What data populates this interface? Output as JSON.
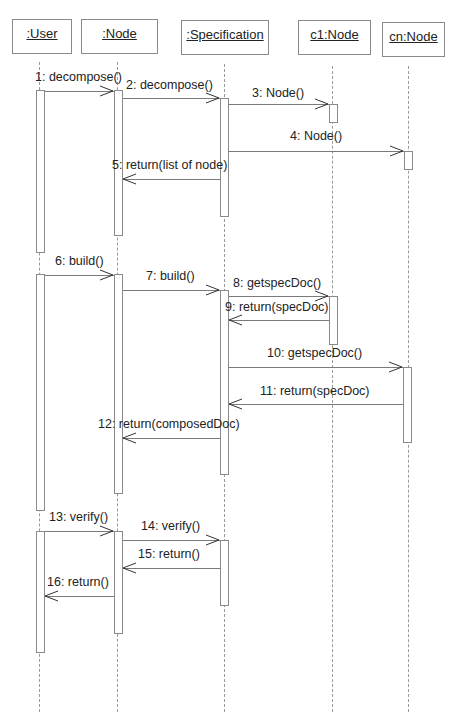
{
  "diagram": {
    "type": "uml-sequence",
    "objects": [
      {
        "id": "user",
        "label": ":User"
      },
      {
        "id": "node",
        "label": ":Node"
      },
      {
        "id": "spec",
        "label": ":Specification"
      },
      {
        "id": "c1",
        "label": "c1:Node"
      },
      {
        "id": "cn",
        "label": "cn:Node"
      }
    ],
    "messages": [
      {
        "n": 1,
        "label": "1: decompose()",
        "from": ":User",
        "to": ":Node",
        "kind": "call"
      },
      {
        "n": 2,
        "label": "2: decompose()",
        "from": ":Node",
        "to": ":Specification",
        "kind": "call"
      },
      {
        "n": 3,
        "label": "3: Node()",
        "from": ":Specification",
        "to": "c1:Node",
        "kind": "create"
      },
      {
        "n": 4,
        "label": "4: Node()",
        "from": ":Specification",
        "to": "cn:Node",
        "kind": "create"
      },
      {
        "n": 5,
        "label": "5: return(list of node)",
        "from": ":Specification",
        "to": ":Node",
        "kind": "return"
      },
      {
        "n": 6,
        "label": "6: build()",
        "from": ":User",
        "to": ":Node",
        "kind": "call"
      },
      {
        "n": 7,
        "label": "7: build()",
        "from": ":Node",
        "to": ":Specification",
        "kind": "call"
      },
      {
        "n": 8,
        "label": "8: getspecDoc()",
        "from": ":Specification",
        "to": "c1:Node",
        "kind": "call"
      },
      {
        "n": 9,
        "label": "9: return(specDoc)",
        "from": "c1:Node",
        "to": ":Specification",
        "kind": "return"
      },
      {
        "n": 10,
        "label": "10: getspecDoc()",
        "from": ":Specification",
        "to": "cn:Node",
        "kind": "call"
      },
      {
        "n": 11,
        "label": "11: return(specDoc)",
        "from": "cn:Node",
        "to": ":Specification",
        "kind": "return"
      },
      {
        "n": 12,
        "label": "12: return(composedDoc)",
        "from": ":Specification",
        "to": ":Node",
        "kind": "return"
      },
      {
        "n": 13,
        "label": "13: verify()",
        "from": ":User",
        "to": ":Node",
        "kind": "call"
      },
      {
        "n": 14,
        "label": "14: verify()",
        "from": ":Node",
        "to": ":Specification",
        "kind": "call"
      },
      {
        "n": 15,
        "label": "15: return()",
        "from": ":Specification",
        "to": ":Node",
        "kind": "return"
      },
      {
        "n": 16,
        "label": "16: return()",
        "from": ":Node",
        "to": ":User",
        "kind": "return"
      }
    ]
  }
}
